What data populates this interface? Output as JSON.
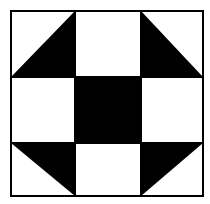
{
  "diagram": {
    "grid": {
      "rows": 3,
      "cols": 3
    },
    "colors": {
      "fill": "#000000",
      "background": "#ffffff",
      "stroke": "#000000"
    },
    "cells": [
      {
        "row": 0,
        "col": 0,
        "type": "half-triangle",
        "black": "bottom-left"
      },
      {
        "row": 0,
        "col": 1,
        "type": "white"
      },
      {
        "row": 0,
        "col": 2,
        "type": "half-triangle",
        "black": "bottom-left-diag"
      },
      {
        "row": 1,
        "col": 0,
        "type": "white"
      },
      {
        "row": 1,
        "col": 1,
        "type": "black"
      },
      {
        "row": 1,
        "col": 2,
        "type": "white"
      },
      {
        "row": 2,
        "col": 0,
        "type": "half-triangle",
        "black": "top-right"
      },
      {
        "row": 2,
        "col": 1,
        "type": "white"
      },
      {
        "row": 2,
        "col": 2,
        "type": "half-triangle",
        "black": "top-left"
      }
    ]
  }
}
